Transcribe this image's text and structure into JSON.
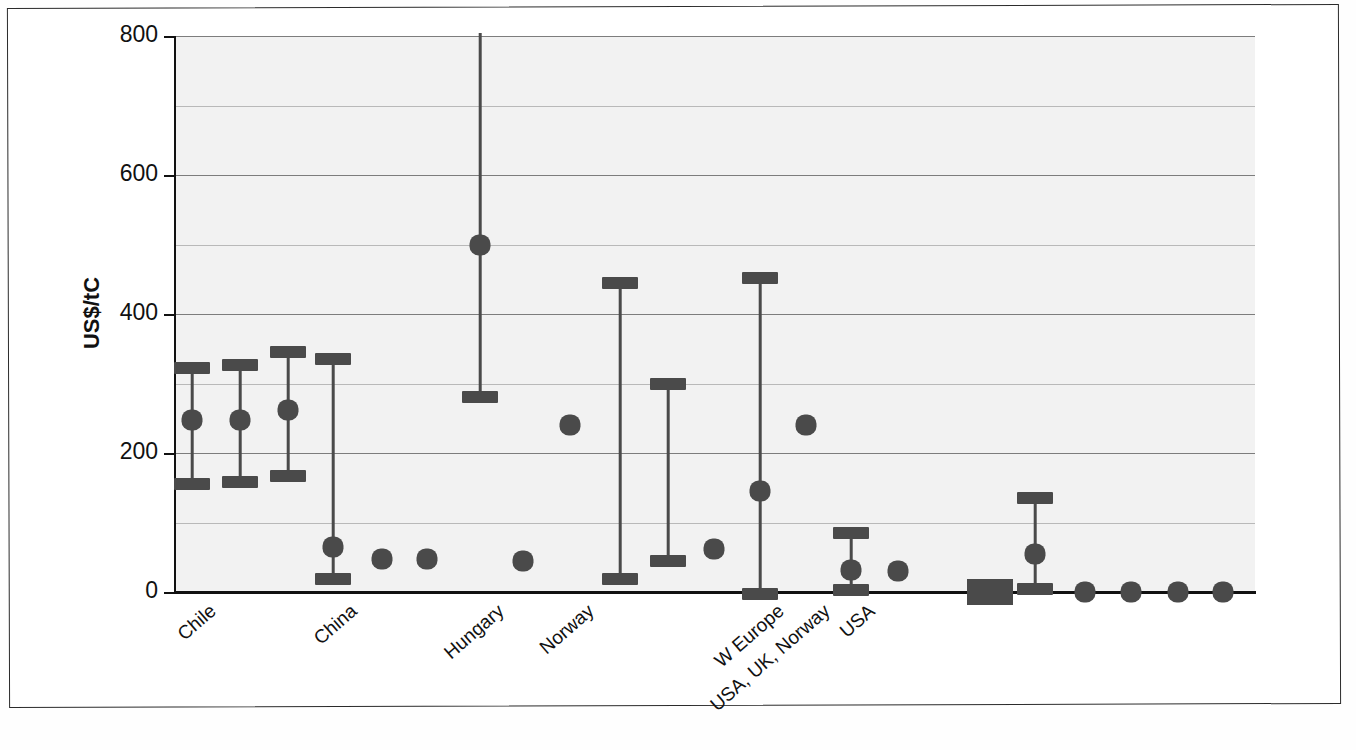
{
  "chart_data": {
    "type": "scatter",
    "title": "",
    "subtitle": "",
    "xlabel": "",
    "ylabel": "US$/tC",
    "ylim": [
      0,
      800
    ],
    "yticks": [
      0,
      200,
      400,
      600,
      800
    ],
    "minor_gridlines": [
      100,
      300,
      500,
      700
    ],
    "grid": true,
    "legend": "none",
    "xtick_labels": [
      {
        "label": "Chile",
        "index": 0
      },
      {
        "label": "China",
        "index": 3
      },
      {
        "label": "Hungary",
        "index": 6
      },
      {
        "label": "Norway",
        "index": 8
      },
      {
        "label": "W Europe",
        "index": 12
      },
      {
        "label": "USA, UK, Norway",
        "index": 13
      },
      {
        "label": "USA",
        "index": 14
      }
    ],
    "points": [
      {
        "x": 192,
        "low": 155,
        "mid": 247,
        "high": 322,
        "has_bar": true,
        "has_dot": true
      },
      {
        "x": 240,
        "low": 158,
        "mid": 248,
        "high": 327,
        "has_bar": true,
        "has_dot": true
      },
      {
        "x": 288,
        "low": 167,
        "mid": 262,
        "high": 345,
        "has_bar": true,
        "has_dot": true
      },
      {
        "x": 333,
        "low": 18,
        "mid": 65,
        "high": 335,
        "has_bar": true,
        "has_dot": true
      },
      {
        "x": 382,
        "low": null,
        "mid": 47,
        "high": null,
        "has_bar": false,
        "has_dot": true
      },
      {
        "x": 427,
        "low": null,
        "mid": 47,
        "high": null,
        "has_bar": false,
        "has_dot": true
      },
      {
        "x": 480,
        "low": 280,
        "mid": 500,
        "high": 812,
        "has_bar": true,
        "has_dot": true,
        "high_clipped": true
      },
      {
        "x": 523,
        "low": null,
        "mid": 45,
        "high": null,
        "has_bar": false,
        "has_dot": true
      },
      {
        "x": 570,
        "low": null,
        "mid": 240,
        "high": null,
        "has_bar": false,
        "has_dot": true
      },
      {
        "x": 620,
        "low": 18,
        "mid": null,
        "high": 445,
        "has_bar": true,
        "has_dot": false
      },
      {
        "x": 668,
        "low": 45,
        "mid": null,
        "high": 300,
        "has_bar": true,
        "has_dot": false
      },
      {
        "x": 714,
        "low": null,
        "mid": 62,
        "high": null,
        "has_bar": false,
        "has_dot": true
      },
      {
        "x": 760,
        "low": -3,
        "mid": 145,
        "high": 452,
        "has_bar": true,
        "has_dot": true
      },
      {
        "x": 806,
        "low": null,
        "mid": 240,
        "high": null,
        "has_bar": false,
        "has_dot": true
      },
      {
        "x": 851,
        "low": 3,
        "mid": 32,
        "high": 85,
        "has_bar": true,
        "has_dot": true
      },
      {
        "x": 898,
        "low": null,
        "mid": 30,
        "high": null,
        "has_bar": false,
        "has_dot": true
      },
      {
        "x": 990,
        "low": null,
        "mid": 0,
        "high": null,
        "has_bar": false,
        "has_dot": false,
        "wide_rect": true
      },
      {
        "x": 1035,
        "low": 5,
        "mid": 55,
        "high": 135,
        "has_bar": true,
        "has_dot": true
      },
      {
        "x": 1085,
        "low": null,
        "mid": 0,
        "high": null,
        "has_bar": false,
        "has_dot": true
      },
      {
        "x": 1131,
        "low": null,
        "mid": 0,
        "high": null,
        "has_bar": false,
        "has_dot": true
      },
      {
        "x": 1178,
        "low": null,
        "mid": 0,
        "high": null,
        "has_bar": false,
        "has_dot": true
      },
      {
        "x": 1223,
        "low": null,
        "mid": 0,
        "high": null,
        "has_bar": false,
        "has_dot": true
      }
    ],
    "marker_color": "#4a4a4a",
    "plot_background": "#f2f2f2",
    "axis_color": "#111111"
  },
  "axis": {
    "y_title": "US$/tC",
    "tick_labels": [
      "800",
      "600",
      "400",
      "200",
      "0"
    ]
  },
  "xcategories": [
    "Chile",
    "China",
    "Hungary",
    "Norway",
    "W Europe",
    "USA, UK, Norway",
    "USA"
  ]
}
